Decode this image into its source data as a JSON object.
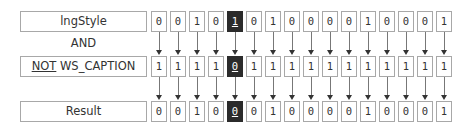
{
  "rows": {
    "style": {
      "label": "lngStyle",
      "bits": [
        "0",
        "0",
        "1",
        "0",
        "1",
        "0",
        "1",
        "0",
        "0",
        "0",
        "0",
        "1",
        "0",
        "0",
        "0",
        "1"
      ]
    },
    "operator": {
      "label": "AND"
    },
    "mask": {
      "label_prefix": "NOT",
      "label_suffix": " WS_CAPTION",
      "bits": [
        "1",
        "1",
        "1",
        "1",
        "0",
        "1",
        "1",
        "1",
        "1",
        "1",
        "1",
        "1",
        "1",
        "1",
        "1",
        "1"
      ]
    },
    "result": {
      "label": "Result",
      "bits": [
        "0",
        "0",
        "1",
        "0",
        "0",
        "0",
        "1",
        "0",
        "0",
        "0",
        "0",
        "1",
        "0",
        "0",
        "0",
        "1"
      ]
    }
  },
  "highlight_index": 4,
  "colors": {
    "highlight_bg": "#2b2b2b",
    "border": "#a8a8a8",
    "arrow": "#333333"
  }
}
